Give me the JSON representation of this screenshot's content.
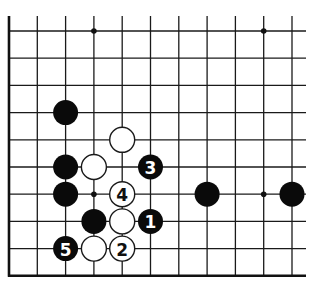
{
  "board": {
    "columns": 11,
    "rows": 10,
    "origin_x": 9,
    "origin_y": 31,
    "spacing_x": 28.3,
    "spacing_y": 27.2,
    "top_extension_y": 16,
    "right_extension_x": 306,
    "edges": [
      "left",
      "bottom"
    ],
    "line_color": "#1a1a1a",
    "stone_radius": 12.5
  },
  "star_points": [
    {
      "col": 3,
      "row": 0
    },
    {
      "col": 9,
      "row": 0
    },
    {
      "col": 3,
      "row": 6
    },
    {
      "col": 9,
      "row": 6
    }
  ],
  "stones": [
    {
      "color": "black",
      "col": 2,
      "row": 3,
      "label": ""
    },
    {
      "color": "white",
      "col": 4,
      "row": 4,
      "label": ""
    },
    {
      "color": "black",
      "col": 2,
      "row": 5,
      "label": ""
    },
    {
      "color": "white",
      "col": 3,
      "row": 5,
      "label": ""
    },
    {
      "color": "black",
      "col": 5,
      "row": 5,
      "label": "3"
    },
    {
      "color": "black",
      "col": 2,
      "row": 6,
      "label": ""
    },
    {
      "color": "white",
      "col": 4,
      "row": 6,
      "label": "4"
    },
    {
      "color": "black",
      "col": 7,
      "row": 6,
      "label": ""
    },
    {
      "color": "black",
      "col": 10,
      "row": 6,
      "label": ""
    },
    {
      "color": "black",
      "col": 3,
      "row": 7,
      "label": ""
    },
    {
      "color": "white",
      "col": 4,
      "row": 7,
      "label": ""
    },
    {
      "color": "black",
      "col": 5,
      "row": 7,
      "label": "1"
    },
    {
      "color": "black",
      "col": 2,
      "row": 8,
      "label": "5"
    },
    {
      "color": "white",
      "col": 3,
      "row": 8,
      "label": ""
    },
    {
      "color": "white",
      "col": 4,
      "row": 8,
      "label": "2"
    }
  ]
}
